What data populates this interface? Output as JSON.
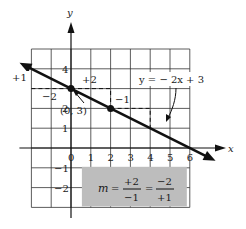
{
  "chart_data": {
    "type": "line",
    "title": "",
    "xlabel": "x",
    "ylabel": "y",
    "xlim": [
      -2,
      7
    ],
    "ylim": [
      -3,
      5
    ],
    "grid": true,
    "x_ticks": [
      "0",
      "1",
      "2",
      "3",
      "4",
      "5",
      "6"
    ],
    "y_ticks": [
      "4",
      "2",
      "1",
      "-1",
      "-2"
    ],
    "line": {
      "equation": "y = -2x + 3",
      "slope": -0.5,
      "intercept": 3,
      "arrows": "both"
    },
    "points": [
      {
        "x": 0,
        "y": 3,
        "label": "(0, 3)"
      },
      {
        "x": 2,
        "y": 2,
        "label": ""
      }
    ],
    "annotations": {
      "equation_label": "y =  − 2x  +  3",
      "point_label": "(0, 3)",
      "rise_left": "+1",
      "run_left": "−2",
      "run_right": "+2",
      "rise_right": "−1",
      "slope_box": {
        "m": "m",
        "eq": "=",
        "num1": "+2",
        "den1": "−1",
        "num2": "−2",
        "den2": "+1"
      }
    },
    "colors": {
      "line": "#111111",
      "grid": "#333333",
      "slope_box": "#bdbdbd"
    }
  }
}
